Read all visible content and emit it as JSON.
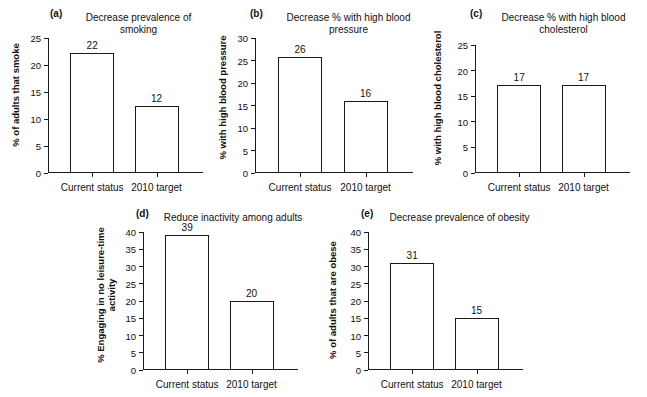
{
  "figure": {
    "background": "#ffffff",
    "ink": "#1a1a1a",
    "x_categories": [
      "Current status",
      "2010 target"
    ]
  },
  "chart_data": [
    {
      "id": "a",
      "panel_label": "(a)",
      "type": "bar",
      "title": "Decrease prevalence of smoking",
      "xlabel": "",
      "ylabel": "% of adults that smoke",
      "categories": [
        "Current status",
        "2010 target"
      ],
      "values": [
        22,
        12
      ],
      "value_labels": [
        "22",
        "12"
      ],
      "plotted_heights": [
        22.3,
        12.5
      ],
      "ylim": [
        0,
        25
      ],
      "yticks": [
        0,
        5,
        10,
        15,
        20,
        25
      ],
      "ytick_labels": [
        "0",
        "5",
        "10",
        "15",
        "20",
        "25"
      ],
      "grid": false,
      "legend": "none"
    },
    {
      "id": "b",
      "panel_label": "(b)",
      "type": "bar",
      "title": "Decrease % with high blood pressure",
      "xlabel": "",
      "ylabel": "% with high blood pressure",
      "categories": [
        "Current status",
        "2010 target"
      ],
      "values": [
        26,
        16
      ],
      "value_labels": [
        "26",
        "16"
      ],
      "plotted_heights": [
        25.7,
        15.9
      ],
      "ylim": [
        0,
        30
      ],
      "yticks": [
        0,
        5,
        10,
        15,
        20,
        25,
        30
      ],
      "ytick_labels": [
        "0",
        "5",
        "10",
        "15",
        "20",
        "25",
        "30"
      ],
      "grid": false,
      "legend": "none"
    },
    {
      "id": "c",
      "panel_label": "(c)",
      "type": "bar",
      "title": "Decrease % with high blood\ncholesterol",
      "xlabel": "",
      "ylabel": "% with high blood cholesterol",
      "categories": [
        "Current status",
        "2010 target"
      ],
      "values": [
        17,
        17
      ],
      "value_labels": [
        "17",
        "17"
      ],
      "plotted_heights": [
        17.1,
        17.1
      ],
      "ylim": [
        0,
        25
      ],
      "yticks": [
        0,
        5,
        10,
        15,
        20,
        25
      ],
      "ytick_labels": [
        "0",
        "5",
        "10",
        "15",
        "20",
        "25"
      ],
      "grid": false,
      "legend": "none"
    },
    {
      "id": "d",
      "panel_label": "(d)",
      "type": "bar",
      "title": "Reduce inactivity among adults",
      "xlabel": "",
      "ylabel": "% Engaging in no leisure-time\nactivity",
      "categories": [
        "Current status",
        "2010 target"
      ],
      "values": [
        39,
        20
      ],
      "value_labels": [
        "39",
        "20"
      ],
      "plotted_heights": [
        39.2,
        20.1
      ],
      "ylim": [
        0,
        40
      ],
      "yticks": [
        0,
        5,
        10,
        15,
        20,
        25,
        30,
        35,
        40
      ],
      "ytick_labels": [
        "0",
        "5",
        "10",
        "15",
        "20",
        "25",
        "30",
        "35",
        "40"
      ],
      "grid": false,
      "legend": "none"
    },
    {
      "id": "e",
      "panel_label": "(e)",
      "type": "bar",
      "title": "Decrease prevalence of obesity",
      "xlabel": "",
      "ylabel": "% of adults that are obese",
      "categories": [
        "Current status",
        "2010 target"
      ],
      "values": [
        31,
        15
      ],
      "value_labels": [
        "31",
        "15"
      ],
      "plotted_heights": [
        31.0,
        15.0
      ],
      "ylim": [
        0,
        40
      ],
      "yticks": [
        0,
        5,
        10,
        15,
        20,
        25,
        30,
        35,
        40
      ],
      "ytick_labels": [
        "0",
        "5",
        "10",
        "15",
        "20",
        "25",
        "30",
        "35",
        "40"
      ],
      "grid": false,
      "legend": "none"
    }
  ]
}
